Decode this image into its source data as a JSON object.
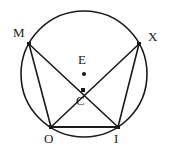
{
  "figure": {
    "background_color": "#ffffff",
    "stroke_color": "#1a1a1a",
    "label_color": "#1a1a1a"
  },
  "circle": {
    "name": "circumscribed-circle",
    "center_x": 84,
    "center_y": 74,
    "radius": 63,
    "stroke_width": 1.6
  },
  "points": [
    {
      "id": "M",
      "label": "M",
      "x": 29,
      "y": 44,
      "label_x": 13,
      "label_y": 26,
      "marker": "square",
      "marker_size": 4
    },
    {
      "id": "X",
      "label": "X",
      "x": 139,
      "y": 44,
      "label_x": 148,
      "label_y": 30,
      "marker": "square",
      "marker_size": 4
    },
    {
      "id": "E",
      "label": "E",
      "x": 84,
      "y": 74,
      "label_x": 78,
      "label_y": 53,
      "marker": "dot",
      "marker_size": 3
    },
    {
      "id": "C",
      "label": "C",
      "x": 83,
      "y": 90,
      "label_x": 76,
      "label_y": 94,
      "marker": "square",
      "marker_size": 4
    },
    {
      "id": "O",
      "label": "O",
      "x": 51,
      "y": 127,
      "label_x": 44,
      "label_y": 132,
      "marker": "square",
      "marker_size": 4
    },
    {
      "id": "I",
      "label": "I",
      "x": 118,
      "y": 127,
      "label_x": 114,
      "label_y": 132,
      "marker": "square",
      "marker_size": 4
    }
  ],
  "segments": [
    {
      "name": "chord-M-I",
      "from": "M",
      "to": "I",
      "stroke_width": 1.6
    },
    {
      "name": "chord-X-O",
      "from": "X",
      "to": "O",
      "stroke_width": 1.6
    },
    {
      "name": "chord-M-O",
      "from": "M",
      "to": "O",
      "stroke_width": 1.6
    },
    {
      "name": "chord-X-I",
      "from": "X",
      "to": "I",
      "stroke_width": 1.6
    },
    {
      "name": "chord-O-I",
      "from": "O",
      "to": "I",
      "stroke_width": 1.8
    }
  ],
  "chart_data": {
    "type": "diagram",
    "labels": [
      "M",
      "X",
      "E",
      "C",
      "O",
      "I"
    ],
    "center_label": "E",
    "intersection_label": "C",
    "vertices_on_circle": [
      "M",
      "X",
      "O",
      "I"
    ],
    "chords": [
      "MI",
      "XO",
      "MO",
      "XI",
      "OI"
    ]
  }
}
